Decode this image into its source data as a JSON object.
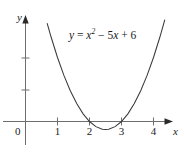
{
  "figure": {
    "equation_text": "y = x² − 5x + 6",
    "equation_parts": {
      "lhs": "y",
      "eq": " = ",
      "var1": "x",
      "exp1": "2",
      "term2": " − 5",
      "var2": "x",
      "term3": " + 6"
    },
    "x_axis_label": "x",
    "y_axis_label": "y",
    "origin_label": "0",
    "curve_color": "#3a3a3a",
    "axis_color": "#6e6e6e",
    "text_color": "#1a1a1a",
    "background_color": "#ffffff"
  },
  "chart_data": {
    "type": "line",
    "title": "",
    "subtitle": "",
    "xlabel": "x",
    "ylabel": "y",
    "grid": false,
    "legend": null,
    "annotations": [
      {
        "text": "y = x² − 5x + 6",
        "x": 1.35,
        "y": 5.0
      }
    ],
    "xlim": [
      -0.8,
      4.9
    ],
    "ylim": [
      -0.9,
      6.3
    ],
    "xticks": [
      1,
      2,
      3,
      4
    ],
    "xticklabels": [
      "1",
      "2",
      "3",
      "4"
    ],
    "yticks": [
      1,
      2
    ],
    "yticklabels": [
      "",
      ""
    ],
    "origin_tick_label": "0",
    "series": [
      {
        "name": "y = x^2 - 5x + 6",
        "function": "y = x^2 - 5x + 6",
        "roots": [
          2,
          3
        ],
        "vertex": [
          2.5,
          -0.25
        ],
        "y_intercept": 6,
        "x": [
          0.68,
          0.8,
          1.0,
          1.2,
          1.4,
          1.6,
          1.8,
          2.0,
          2.2,
          2.4,
          2.5,
          2.6,
          2.8,
          3.0,
          3.2,
          3.4,
          3.6,
          3.8,
          4.0,
          4.2,
          4.35
        ],
        "y": [
          3.06,
          2.64,
          2.0,
          1.44,
          0.96,
          0.56,
          0.24,
          0.0,
          -0.16,
          -0.24,
          -0.25,
          -0.24,
          -0.16,
          0.0,
          0.24,
          0.56,
          0.96,
          1.44,
          2.0,
          2.64,
          3.17
        ]
      }
    ]
  }
}
